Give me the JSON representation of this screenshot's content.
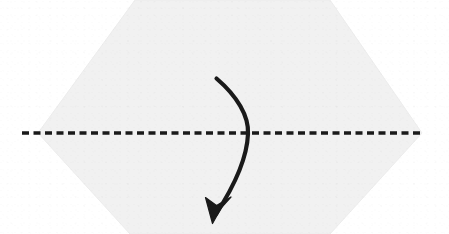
{
  "figure": {
    "kind": "origami-fold-diagram",
    "caption": "Valley fold the flap downward across the horizontal crease line",
    "width": 449,
    "height": 234,
    "background_color": "#ffffff"
  },
  "colors": {
    "paper_fill": "#f1f1f1",
    "paper_edge": "#e6e6e6",
    "ink": "#1a1a1a",
    "background": "#ffffff"
  },
  "paper": {
    "label": "Paper sheet",
    "shape": "hexagon",
    "fill": "#f1f1f1",
    "outline_points": "135,0 330,0 422,133 330,234 130,234 38,133",
    "left_vertex": [
      38,
      133
    ],
    "right_vertex": [
      422,
      133
    ],
    "top_edge_y": 0,
    "bottom_edge_y": 234
  },
  "crease_line": {
    "label": "Fold crease line",
    "style": "dashed",
    "color": "#1a1a1a",
    "stroke_width": 3.4,
    "dash_pattern": "7 4.5",
    "x_start": 22,
    "x_end": 424,
    "y": 133
  },
  "fold_arrow": {
    "label": "Fold direction arrow",
    "color": "#1a1a1a",
    "stroke_width": 4.2,
    "path": "M 216.5 78.5 C 237 96 249 116 248 134 C 247 158 233 188 216 214",
    "start_point": [
      216,
      78
    ],
    "crossing_point": [
      248,
      133
    ],
    "tip_point": [
      212,
      222
    ],
    "head_style": "barbed",
    "head_points": "212.5,223.5 205.5,197.5 216.5,205.5 231,197 221.5,207.5"
  },
  "alt_text": "An origami instruction diagram: a light grey hexagonal sheet of paper with a horizontal black dashed crease line through its middle, and a curved arrow sweeping from the upper middle downward across the crease, indicating a downward fold."
}
